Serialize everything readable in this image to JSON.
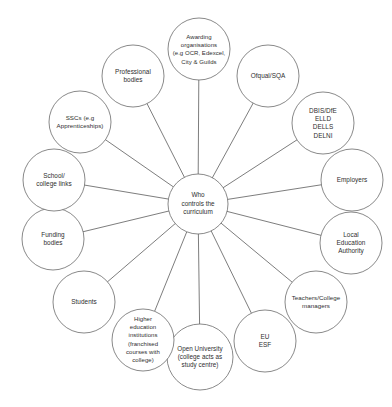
{
  "canvas": {
    "width": 392,
    "height": 407,
    "background": "#ffffff",
    "stroke_color": "#6b6b6b",
    "spoke_color": "#5c5c5c",
    "text_color": "#2e2e2e"
  },
  "diagram": {
    "type": "hub-and-spoke",
    "title": "Who controls the curriculum",
    "center": {
      "label": "Who\ncontrols the\ncurriculum",
      "cx": 198,
      "cy": 204,
      "r": 30
    },
    "nodes": [
      {
        "id": "awarding-organisations",
        "label": "Awarding\norganisations\n(e.g OCR, Edexcel,\nCity & Guilds",
        "cx": 199,
        "cy": 49,
        "r": 31,
        "font_size": 6.0
      },
      {
        "id": "ofqual-sqa",
        "label": "Ofqual/SQA",
        "cx": 268,
        "cy": 76,
        "r": 31,
        "font_size": 6.4
      },
      {
        "id": "dbis-dfe-elld-dells-delni",
        "label": "DBIS/DfE\nELLD\nDELLS\nDELNI",
        "cx": 323,
        "cy": 123,
        "r": 31,
        "font_size": 6.4
      },
      {
        "id": "employers",
        "label": "Employers",
        "cx": 352,
        "cy": 180,
        "r": 31,
        "font_size": 6.4
      },
      {
        "id": "local-education-authority",
        "label": "Local\nEducation\nAuthority",
        "cx": 351,
        "cy": 243,
        "r": 31,
        "font_size": 6.4
      },
      {
        "id": "teachers-college-managers",
        "label": "Teachers/College\nmanagers",
        "cx": 316,
        "cy": 302,
        "r": 31,
        "font_size": 6.2
      },
      {
        "id": "eu-esf",
        "label": "EU\nESF",
        "cx": 265,
        "cy": 341,
        "r": 31,
        "font_size": 6.4
      },
      {
        "id": "open-university",
        "label": "Open University\n(college acts as\nstudy centre)",
        "cx": 200,
        "cy": 357,
        "r": 33,
        "font_size": 6.3
      },
      {
        "id": "higher-education-institutions",
        "label": "Higher\neducation\ninstitutions\n(franchised\ncourses with\ncollege)",
        "cx": 143,
        "cy": 340,
        "r": 31,
        "font_size": 6.0
      },
      {
        "id": "students",
        "label": "Students",
        "cx": 84,
        "cy": 302,
        "r": 31,
        "font_size": 6.4
      },
      {
        "id": "funding-bodies",
        "label": "Funding\nbodies",
        "cx": 53,
        "cy": 239,
        "r": 31,
        "font_size": 6.4
      },
      {
        "id": "school-college-links",
        "label": "School/\ncollege links",
        "cx": 54,
        "cy": 180,
        "r": 31,
        "font_size": 6.4
      },
      {
        "id": "sscs-apprenticeships",
        "label": "SSCs (e.g\nApprenticeships)",
        "cx": 80,
        "cy": 122,
        "r": 31,
        "font_size": 6.2
      },
      {
        "id": "professional-bodies",
        "label": "Professional\nbodies",
        "cx": 133,
        "cy": 76,
        "r": 31,
        "font_size": 6.4
      }
    ]
  }
}
